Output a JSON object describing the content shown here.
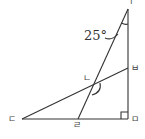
{
  "diagram": {
    "type": "geometry",
    "points": {
      "top": {
        "label": "ㄱ",
        "x": 128,
        "y": 9
      },
      "intersection": {
        "label": "ㄴ",
        "x": 93,
        "y": 86
      },
      "left": {
        "label": "ㄷ",
        "x": 22,
        "y": 119
      },
      "bottom_mid": {
        "label": "ㄹ",
        "x": 78,
        "y": 119
      },
      "right_angle": {
        "label": "ㅁ",
        "x": 128,
        "y": 119
      },
      "right_mid": {
        "label": "ㅂ",
        "x": 128,
        "y": 68
      }
    },
    "segments": [
      "ㄱㅁ",
      "ㄷㅁ",
      "ㄱㄹ",
      "ㄷㅂ"
    ],
    "angle_label": "25°",
    "right_angle_at": "ㅁ",
    "line_color": "#333333"
  }
}
